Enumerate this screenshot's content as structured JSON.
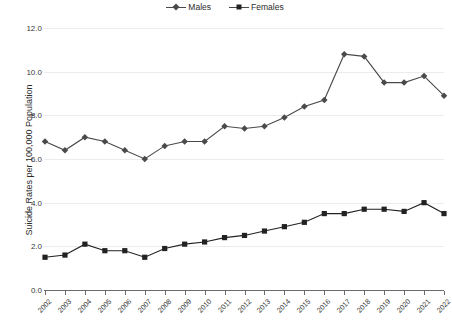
{
  "chart_data": {
    "type": "line",
    "title": "",
    "xlabel": "",
    "ylabel": "Suicide Rates per 100,000 Population",
    "categories": [
      "2002",
      "2003",
      "2004",
      "2005",
      "2006",
      "2007",
      "2008",
      "2009",
      "2010",
      "2011",
      "2012",
      "2013",
      "2014",
      "2015",
      "2016",
      "2017",
      "2018",
      "2019",
      "2020",
      "2021",
      "2022"
    ],
    "ylim": [
      0.0,
      12.0
    ],
    "yticks": [
      "0.0",
      "2.0",
      "4.0",
      "6.0",
      "8.0",
      "10.0",
      "12.0"
    ],
    "ytick_values": [
      0.0,
      2.0,
      4.0,
      6.0,
      8.0,
      10.0,
      12.0
    ],
    "grid": true,
    "legend_position": "top-center",
    "series": [
      {
        "name": "Males",
        "marker": "diamond",
        "color": "#4a4a4a",
        "values": [
          6.8,
          6.4,
          7.0,
          6.8,
          6.4,
          6.0,
          6.6,
          6.8,
          6.8,
          7.5,
          7.4,
          7.5,
          7.9,
          8.4,
          8.7,
          10.8,
          10.7,
          9.5,
          9.5,
          9.8,
          8.9
        ]
      },
      {
        "name": "Females",
        "marker": "square",
        "color": "#222222",
        "values": [
          1.5,
          1.6,
          2.1,
          1.8,
          1.8,
          1.5,
          1.9,
          2.1,
          2.2,
          2.4,
          2.5,
          2.7,
          2.9,
          3.1,
          3.5,
          3.5,
          3.7,
          3.7,
          3.6,
          4.0,
          3.5
        ]
      }
    ]
  },
  "legend": {
    "items": [
      {
        "label": "Males"
      },
      {
        "label": "Females"
      }
    ]
  }
}
